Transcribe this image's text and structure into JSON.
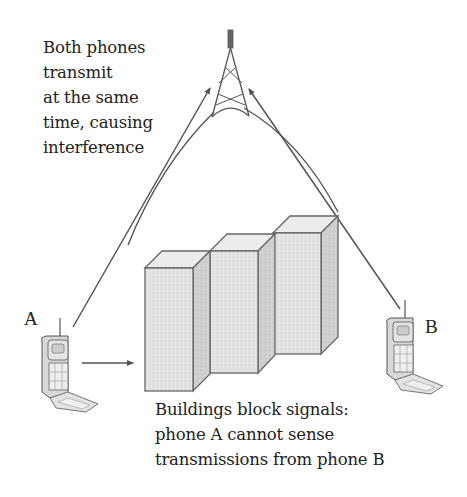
{
  "diagram": {
    "top_caption": [
      "Both phones",
      "transmit",
      "at the same",
      "time, causing",
      "interference"
    ],
    "bottom_caption": [
      "Buildings block signals:",
      "phone A cannot sense",
      "transmissions from phone B"
    ],
    "phone_a_label": "A",
    "phone_b_label": "B",
    "nodes": [
      {
        "id": "tower",
        "label": "Cell tower"
      },
      {
        "id": "phone-a",
        "label": "A"
      },
      {
        "id": "phone-b",
        "label": "B"
      },
      {
        "id": "buildings",
        "label": "Buildings (3 blocks)"
      }
    ],
    "edges": [
      {
        "from": "phone-a",
        "to": "tower",
        "type": "arrow"
      },
      {
        "from": "phone-b",
        "to": "tower",
        "type": "arrow"
      },
      {
        "from": "phone-a",
        "to": "buildings",
        "type": "arrow"
      }
    ],
    "colors": {
      "line": "#555555",
      "building_front": "#e4e4e4",
      "building_top": "#ececec",
      "building_side": "#d2d2d2",
      "text": "#222222"
    }
  }
}
